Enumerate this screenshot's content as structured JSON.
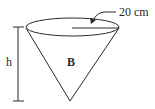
{
  "figure": {
    "shape": "inverted cone",
    "cone_label": "B",
    "radius_label": "20 cm",
    "height_label": "h",
    "stroke_color": "#2a2a2a",
    "background_color": "#ffffff"
  }
}
